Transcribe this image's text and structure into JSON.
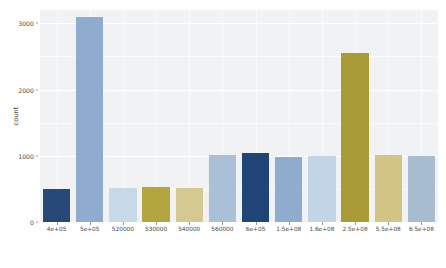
{
  "chart_data": {
    "type": "bar",
    "title": "",
    "subtitle": "",
    "xlabel": "",
    "ylabel": "count",
    "grid": true,
    "legend": false,
    "legend_position": "none",
    "ylim": [
      0,
      3200
    ],
    "y_ticks": [
      0,
      1000,
      2000,
      3000
    ],
    "y_tick_labels": [
      "0",
      "1000",
      "2000",
      "3000"
    ],
    "categories": [
      "4e+05",
      "5e+05",
      "520000",
      "530000",
      "540000",
      "560000",
      "6e+05",
      "1.5e+08",
      "1.6e+08",
      "2.5e+08",
      "5.5e+08",
      "6.5e+08"
    ],
    "values": [
      505,
      3100,
      520,
      530,
      520,
      1010,
      1035,
      980,
      1000,
      2550,
      1015,
      990
    ],
    "bar_colors": [
      "#26497a",
      "#8fabcd",
      "#c7d8e7",
      "#b3a63f",
      "#d6c891",
      "#a8c0d8",
      "#1f4477",
      "#8fabcd",
      "#c2d5e6",
      "#a89a34",
      "#d2c484",
      "#a8bcd0"
    ],
    "panel_background": "#f1f2f4",
    "gridline_color": "#ffffff",
    "axis_text_color": "#4a4a4a"
  },
  "axis": {
    "y_title": "count"
  }
}
